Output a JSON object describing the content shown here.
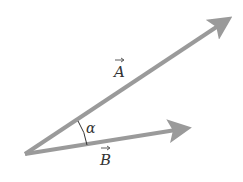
{
  "diagram": {
    "vectors": [
      {
        "name": "A",
        "label": "A",
        "from": [
          25,
          154
        ],
        "to": [
          231,
          17
        ]
      },
      {
        "name": "B",
        "label": "B",
        "from": [
          25,
          154
        ],
        "to": [
          190,
          128
        ]
      }
    ],
    "angle": {
      "label": "α",
      "between": [
        "A",
        "B"
      ]
    },
    "colors": {
      "vector": "#9a9a9a",
      "text": "#333333",
      "background": "#ffffff"
    }
  }
}
